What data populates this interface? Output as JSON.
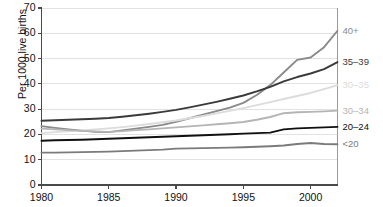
{
  "chart_data": {
    "type": "line",
    "title": "",
    "subtitle": "",
    "xlabel": "",
    "ylabel": "Per 1000 live births",
    "xlim": [
      1980,
      2002
    ],
    "ylim": [
      0,
      70
    ],
    "ytick_labels": [
      "0",
      "10",
      "20",
      "30",
      "40",
      "50",
      "60",
      "70"
    ],
    "ytick_values": [
      0,
      10,
      20,
      30,
      40,
      50,
      60,
      70
    ],
    "xtick_labels": [
      "1980",
      "1985",
      "1990",
      "1995",
      "2000"
    ],
    "xtick_values": [
      1980,
      1985,
      1990,
      1995,
      2000
    ],
    "grid": "horizontal",
    "legend_position": "right-inline-labels",
    "x": [
      1980,
      1981,
      1982,
      1983,
      1984,
      1985,
      1986,
      1987,
      1988,
      1989,
      1990,
      1991,
      1992,
      1993,
      1994,
      1995,
      1996,
      1997,
      1998,
      1999,
      2000,
      2001,
      2002
    ],
    "series": [
      {
        "name": "40+",
        "label": "40+",
        "color": "#8a8a8a",
        "values": [
          23.3,
          22.6,
          22.0,
          21.5,
          21.0,
          20.9,
          21.6,
          22.3,
          23.0,
          23.8,
          25.0,
          26.4,
          27.8,
          29.2,
          30.6,
          32.5,
          35.6,
          39.5,
          44.5,
          49.5,
          50.4,
          54.5,
          61.0
        ]
      },
      {
        "name": "35-39",
        "label": "35–39",
        "color": "#3a3a3a",
        "values": [
          25.4,
          25.6,
          25.8,
          26.0,
          26.2,
          26.5,
          27.0,
          27.6,
          28.2,
          28.9,
          29.7,
          30.7,
          31.8,
          32.9,
          34.1,
          35.4,
          37.0,
          38.8,
          41.0,
          42.7,
          44.1,
          45.8,
          48.6
        ]
      },
      {
        "name": "30-35",
        "label": "30–35",
        "color": "#dcdcdc",
        "values": [
          20.5,
          20.9,
          21.2,
          21.6,
          22.0,
          22.4,
          22.9,
          23.5,
          24.1,
          24.8,
          25.5,
          26.4,
          27.3,
          28.3,
          29.3,
          30.4,
          31.6,
          32.8,
          34.0,
          35.2,
          36.4,
          37.9,
          39.5
        ]
      },
      {
        "name": "30-34",
        "label": "30–34",
        "color": "#b5b5b5",
        "values": [
          22.3,
          22.0,
          21.7,
          21.4,
          21.2,
          21.0,
          21.3,
          21.7,
          22.0,
          22.4,
          22.8,
          23.2,
          23.6,
          24.0,
          24.4,
          24.9,
          25.8,
          26.9,
          28.4,
          28.8,
          28.9,
          29.1,
          29.4
        ]
      },
      {
        "name": "20-24",
        "label": "20–24",
        "color": "#101010",
        "values": [
          17.5,
          17.7,
          17.8,
          17.9,
          18.1,
          18.3,
          18.5,
          18.7,
          18.9,
          19.1,
          19.3,
          19.5,
          19.7,
          19.9,
          20.1,
          20.3,
          20.5,
          20.7,
          22.0,
          22.4,
          22.6,
          22.8,
          23.0
        ]
      },
      {
        "name": "<20",
        "label": "<20",
        "color": "#7b7b7b",
        "values": [
          12.8,
          12.8,
          12.9,
          13.0,
          13.1,
          13.2,
          13.4,
          13.6,
          13.8,
          14.0,
          14.4,
          14.5,
          14.6,
          14.7,
          14.8,
          14.9,
          15.1,
          15.3,
          15.6,
          16.2,
          16.6,
          16.2,
          16.1
        ]
      }
    ]
  }
}
